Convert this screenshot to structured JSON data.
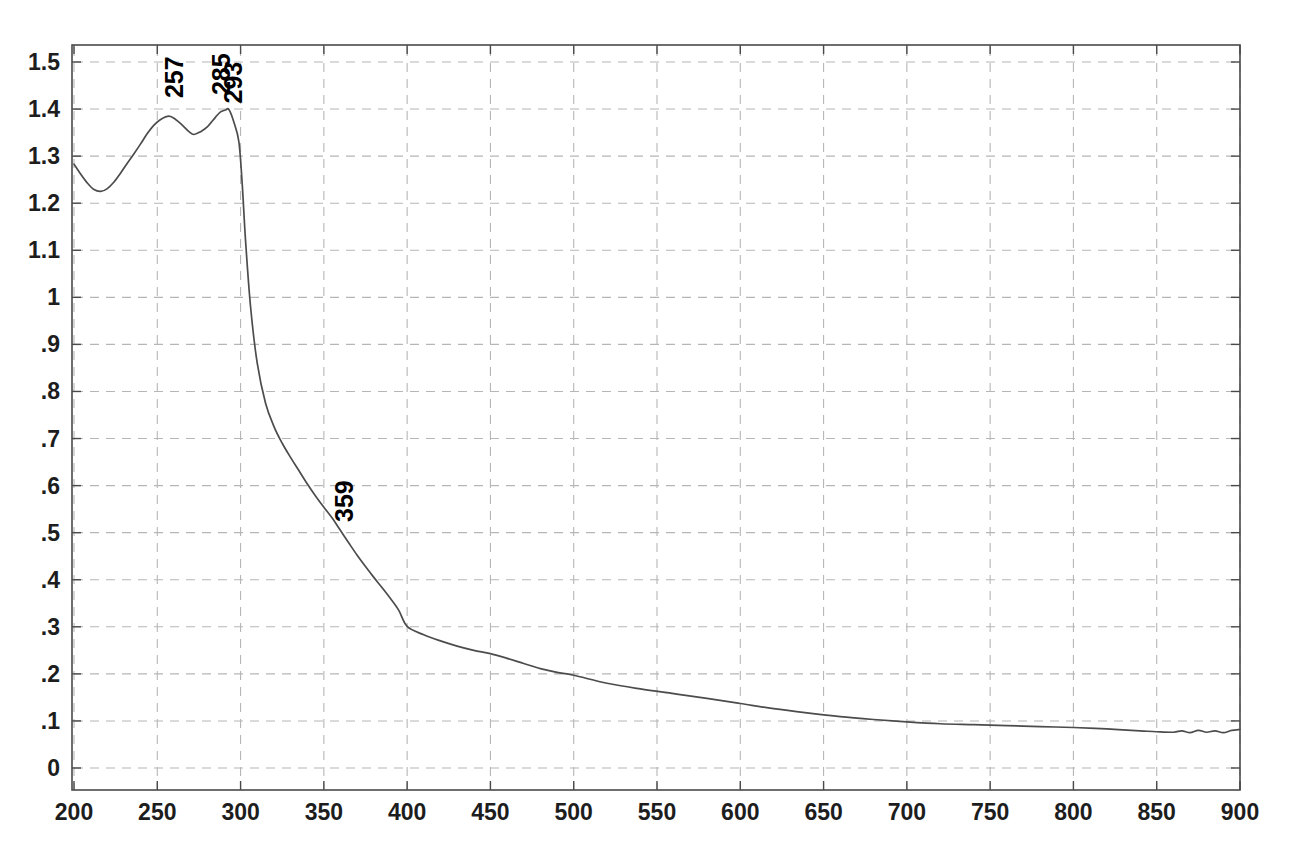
{
  "chart_data": {
    "type": "line",
    "title": "",
    "subtitle": "",
    "xlabel": "",
    "ylabel": "",
    "xlim": [
      200,
      900
    ],
    "ylim": [
      0,
      1.5
    ],
    "grid": true,
    "legend": "none",
    "x_ticks": [
      200,
      250,
      300,
      350,
      400,
      450,
      500,
      550,
      600,
      650,
      700,
      750,
      800,
      850,
      900
    ],
    "x_tick_labels": [
      "200",
      "250",
      "300",
      "350",
      "400",
      "450",
      "500",
      "550",
      "600",
      "650",
      "700",
      "750",
      "800",
      "850",
      "900"
    ],
    "y_ticks": [
      0,
      0.1,
      0.2,
      0.3,
      0.4,
      0.5,
      0.6,
      0.7,
      0.8,
      0.9,
      1.0,
      1.1,
      1.2,
      1.3,
      1.4,
      1.5
    ],
    "y_tick_labels": [
      "0",
      ".1",
      ".2",
      ".3",
      ".4",
      ".5",
      ".6",
      ".7",
      ".8",
      ".9",
      "1",
      "1.1",
      "1.2",
      "1.3",
      "1.4",
      "1.5"
    ],
    "series": [
      {
        "name": "absorbance",
        "color": "#4c4c4c",
        "x": [
          200,
          204,
          208,
          212,
          216,
          220,
          224,
          228,
          232,
          236,
          240,
          244,
          248,
          252,
          257,
          261,
          265,
          269,
          272,
          276,
          280,
          285,
          288,
          291,
          293,
          296,
          299,
          301,
          303,
          306,
          310,
          315,
          320,
          325,
          330,
          335,
          340,
          345,
          350,
          355,
          359,
          365,
          370,
          375,
          380,
          385,
          390,
          395,
          400,
          410,
          420,
          430,
          440,
          450,
          460,
          470,
          480,
          490,
          500,
          520,
          540,
          560,
          580,
          600,
          620,
          640,
          660,
          680,
          700,
          720,
          740,
          760,
          780,
          800,
          820,
          840,
          850,
          860,
          865,
          870,
          875,
          880,
          885,
          890,
          895,
          900
        ],
        "y": [
          1.283,
          1.262,
          1.243,
          1.229,
          1.225,
          1.231,
          1.245,
          1.264,
          1.285,
          1.305,
          1.326,
          1.348,
          1.366,
          1.378,
          1.385,
          1.378,
          1.366,
          1.352,
          1.346,
          1.352,
          1.362,
          1.383,
          1.394,
          1.398,
          1.399,
          1.372,
          1.33,
          1.24,
          1.12,
          0.98,
          0.86,
          0.775,
          0.726,
          0.69,
          0.66,
          0.632,
          0.604,
          0.578,
          0.554,
          0.531,
          0.51,
          0.478,
          0.452,
          0.428,
          0.405,
          0.383,
          0.36,
          0.335,
          0.301,
          0.283,
          0.27,
          0.259,
          0.25,
          0.243,
          0.233,
          0.222,
          0.211,
          0.203,
          0.197,
          0.18,
          0.168,
          0.158,
          0.148,
          0.137,
          0.126,
          0.117,
          0.109,
          0.103,
          0.098,
          0.094,
          0.092,
          0.09,
          0.088,
          0.086,
          0.083,
          0.079,
          0.077,
          0.076,
          0.079,
          0.075,
          0.08,
          0.076,
          0.079,
          0.075,
          0.08,
          0.082
        ]
      }
    ],
    "annotations": [
      {
        "label": "257",
        "x": 257,
        "y": 1.385,
        "rotation": -90
      },
      {
        "label": "285",
        "x": 285,
        "y": 1.383,
        "rotation": -90
      },
      {
        "label": "293",
        "x": 293,
        "y": 1.399,
        "rotation": -90
      },
      {
        "label": "359",
        "x": 359,
        "y": 0.51,
        "rotation": -90
      }
    ]
  },
  "axes": {
    "x_axis_name": "wavelength-axis",
    "y_axis_name": "absorbance-axis"
  },
  "colors": {
    "curve": "#4c4c4c",
    "grid": "#b6b6b6",
    "frame": "#4a4a4a",
    "text": "#1d1d1d",
    "background": "#ffffff"
  }
}
